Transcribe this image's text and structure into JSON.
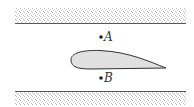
{
  "diagram": {
    "colors": {
      "wall_stipple": "#c8c8c8",
      "wall_line": "#555555",
      "airfoil_fill": "#e0e0e0",
      "airfoil_stroke": "#333333",
      "point": "#222222"
    },
    "points": [
      {
        "label": "A",
        "x": 101,
        "y": 37
      },
      {
        "label": "B",
        "x": 101,
        "y": 78
      }
    ]
  }
}
